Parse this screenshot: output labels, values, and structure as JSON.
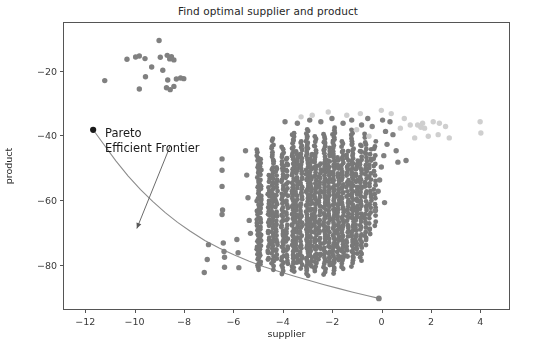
{
  "chart_data": {
    "type": "scatter",
    "title": "Find optimal supplier and product",
    "xlabel": "supplier",
    "ylabel": "product",
    "xlim": [
      -12.9,
      5.2
    ],
    "ylim": [
      -94.0,
      -5.0
    ],
    "grid": false,
    "legend": null,
    "xticks": [
      -12,
      -10,
      -8,
      -6,
      -4,
      -2,
      0,
      2,
      4
    ],
    "xtick_labels": [
      "−12",
      "−10",
      "−8",
      "−6",
      "−4",
      "−2",
      "0",
      "2",
      "4"
    ],
    "yticks": [
      -20,
      -40,
      -60,
      -80
    ],
    "ytick_labels": [
      "−20",
      "−40",
      "−60",
      "−80"
    ],
    "annotations": [
      {
        "text_lines": [
          "Pareto",
          "Efficient Frontier"
        ],
        "text_x": -10.3,
        "text_y": -30.5,
        "arrow_tip_x": -9.95,
        "arrow_tip_y": -68.5,
        "arrow_tail_x": -8.6,
        "arrow_tail_y": -43.0
      }
    ],
    "series": [
      {
        "name": "pareto-frontier-curve",
        "type": "line",
        "color": "#8c8c8c",
        "linewidth": 1.1,
        "points": [
          [
            -11.72,
            -38.0
          ],
          [
            -11.3,
            -42.4
          ],
          [
            -10.8,
            -47.6
          ],
          [
            -10.3,
            -52.3
          ],
          [
            -9.8,
            -56.5
          ],
          [
            -9.3,
            -60.2
          ],
          [
            -8.8,
            -63.6
          ],
          [
            -8.3,
            -66.6
          ],
          [
            -7.8,
            -69.3
          ],
          [
            -7.2,
            -72.2
          ],
          [
            -6.6,
            -74.6
          ],
          [
            -6.0,
            -76.7
          ],
          [
            -5.4,
            -78.6
          ],
          [
            -4.8,
            -80.3
          ],
          [
            -4.2,
            -81.8
          ],
          [
            -3.6,
            -83.2
          ],
          [
            -3.0,
            -84.5
          ],
          [
            -2.4,
            -85.8
          ],
          [
            -1.8,
            -87.0
          ],
          [
            -1.2,
            -88.2
          ],
          [
            -0.6,
            -89.3
          ],
          [
            -0.15,
            -90.1
          ]
        ]
      },
      {
        "name": "frontier-endpoint-optimal",
        "type": "scatter",
        "color": "#1a1a1a",
        "size": 5.0,
        "points": [
          [
            -11.72,
            -38.0
          ]
        ]
      },
      {
        "name": "frontier-endpoint-right",
        "type": "scatter",
        "color": "#808080",
        "size": 4.6,
        "points": [
          [
            -0.15,
            -90.1
          ]
        ]
      },
      {
        "name": "frontier-point-mid",
        "type": "scatter",
        "color": "#808080",
        "size": 4.2,
        "points": [
          [
            -7.22,
            -82.1
          ]
        ]
      },
      {
        "name": "upper-left-cluster",
        "type": "scatter",
        "color": "#808080",
        "size": 4.2,
        "points": [
          [
            -9.05,
            -10.4
          ],
          [
            -10.35,
            -16.2
          ],
          [
            -10.0,
            -15.5
          ],
          [
            -9.85,
            -15.2
          ],
          [
            -9.62,
            -16.0
          ],
          [
            -9.0,
            -15.6
          ],
          [
            -8.72,
            -15.0
          ],
          [
            -8.55,
            -15.4
          ],
          [
            -8.62,
            -16.1
          ],
          [
            -8.45,
            -16.4
          ],
          [
            -9.35,
            -18.6
          ],
          [
            -8.9,
            -19.6
          ],
          [
            -9.6,
            -21.6
          ],
          [
            -8.7,
            -22.6
          ],
          [
            -8.35,
            -22.3
          ],
          [
            -8.18,
            -22.0
          ],
          [
            -8.05,
            -22.2
          ],
          [
            -11.25,
            -22.8
          ],
          [
            -9.85,
            -25.4
          ],
          [
            -8.75,
            -25.0
          ],
          [
            -8.6,
            -25.6
          ],
          [
            -8.45,
            -24.6
          ]
        ]
      },
      {
        "name": "sparse-mid-left-points",
        "type": "scatter",
        "color": "#808080",
        "size": 4.2,
        "points": [
          [
            -6.5,
            -47.0
          ],
          [
            -6.5,
            -50.5
          ],
          [
            -6.5,
            -55.5
          ],
          [
            -6.48,
            -62.8
          ],
          [
            -6.5,
            -64.2
          ],
          [
            -6.45,
            -73.0
          ],
          [
            -6.42,
            -75.6
          ],
          [
            -6.4,
            -77.4
          ],
          [
            -6.4,
            -80.5
          ],
          [
            -7.05,
            -73.5
          ],
          [
            -7.1,
            -78.1
          ],
          [
            -5.9,
            -71.9
          ],
          [
            -5.85,
            -76.0
          ],
          [
            -5.82,
            -80.6
          ],
          [
            -5.55,
            -44.5
          ],
          [
            -5.5,
            -52.0
          ],
          [
            -5.45,
            -59.0
          ],
          [
            -5.4,
            -66.0
          ],
          [
            -5.35,
            -70.0
          ]
        ]
      },
      {
        "name": "dense-striped-band",
        "type": "scatter-columns",
        "color": "#787878",
        "size": 3.9,
        "columns": [
          {
            "x": -5.05,
            "ymin": -82.0,
            "ymax": -44.0,
            "n": 46
          },
          {
            "x": -4.95,
            "ymin": -80.0,
            "ymax": -47.0,
            "n": 34
          },
          {
            "x": -4.62,
            "ymin": -79.0,
            "ymax": -52.0,
            "n": 26
          },
          {
            "x": -4.45,
            "ymin": -81.5,
            "ymax": -40.5,
            "n": 52
          },
          {
            "x": -4.3,
            "ymin": -78.0,
            "ymax": -49.0,
            "n": 30
          },
          {
            "x": -4.05,
            "ymin": -83.0,
            "ymax": -43.0,
            "n": 48
          },
          {
            "x": -3.88,
            "ymin": -80.0,
            "ymax": -46.0,
            "n": 36
          },
          {
            "x": -3.62,
            "ymin": -82.5,
            "ymax": -38.5,
            "n": 62
          },
          {
            "x": -3.48,
            "ymin": -79.5,
            "ymax": -44.0,
            "n": 40
          },
          {
            "x": -3.3,
            "ymin": -81.0,
            "ymax": -41.0,
            "n": 50
          },
          {
            "x": -3.05,
            "ymin": -83.5,
            "ymax": -37.5,
            "n": 66
          },
          {
            "x": -2.9,
            "ymin": -80.5,
            "ymax": -45.0,
            "n": 42
          },
          {
            "x": -2.72,
            "ymin": -82.0,
            "ymax": -40.0,
            "n": 54
          },
          {
            "x": -2.55,
            "ymin": -78.5,
            "ymax": -48.0,
            "n": 32
          },
          {
            "x": -2.35,
            "ymin": -83.0,
            "ymax": -39.0,
            "n": 58
          },
          {
            "x": -2.18,
            "ymin": -80.0,
            "ymax": -43.5,
            "n": 44
          },
          {
            "x": -1.98,
            "ymin": -82.5,
            "ymax": -37.0,
            "n": 64
          },
          {
            "x": -1.8,
            "ymin": -79.0,
            "ymax": -46.5,
            "n": 38
          },
          {
            "x": -1.62,
            "ymin": -81.5,
            "ymax": -41.5,
            "n": 50
          },
          {
            "x": -1.42,
            "ymin": -78.0,
            "ymax": -44.5,
            "n": 36
          },
          {
            "x": -1.22,
            "ymin": -80.5,
            "ymax": -38.0,
            "n": 56
          },
          {
            "x": -1.05,
            "ymin": -76.5,
            "ymax": -47.0,
            "n": 30
          },
          {
            "x": -0.88,
            "ymin": -79.0,
            "ymax": -42.0,
            "n": 40
          },
          {
            "x": -0.68,
            "ymin": -74.0,
            "ymax": -39.0,
            "n": 34
          },
          {
            "x": -0.5,
            "ymin": -71.0,
            "ymax": -44.0,
            "n": 24
          },
          {
            "x": -0.32,
            "ymin": -68.0,
            "ymax": -41.0,
            "n": 20
          }
        ]
      },
      {
        "name": "right-tail-dark-points",
        "type": "scatter",
        "color": "#808080",
        "size": 4.2,
        "points": [
          [
            -0.18,
            -57.0
          ],
          [
            -0.12,
            -53.5
          ],
          [
            -0.05,
            -49.5
          ],
          [
            0.05,
            -46.0
          ],
          [
            0.18,
            -42.5
          ],
          [
            0.12,
            -38.5
          ],
          [
            0.42,
            -39.5
          ],
          [
            0.3,
            -35.5
          ],
          [
            0.55,
            -44.5
          ],
          [
            0.08,
            -60.5
          ],
          [
            -0.3,
            -63.0
          ],
          [
            0.62,
            -48.0
          ],
          [
            0.95,
            -47.5
          ],
          [
            -0.42,
            -37.0
          ],
          [
            0.0,
            -35.0
          ],
          [
            -0.6,
            -34.5
          ],
          [
            -0.85,
            -36.5
          ],
          [
            -1.25,
            -35.0
          ],
          [
            -1.6,
            -36.0
          ],
          [
            -2.05,
            -34.5
          ],
          [
            -2.5,
            -35.5
          ],
          [
            -2.95,
            -35.0
          ],
          [
            -3.45,
            -36.0
          ],
          [
            -3.95,
            -35.5
          ]
        ]
      },
      {
        "name": "right-light-cluster",
        "type": "scatter",
        "color": "#cfcfcf",
        "size": 4.2,
        "points": [
          [
            1.42,
            -36.5
          ],
          [
            1.55,
            -37.2
          ],
          [
            1.62,
            -36.0
          ],
          [
            1.7,
            -37.5
          ],
          [
            2.05,
            -35.5
          ],
          [
            2.3,
            -36.0
          ],
          [
            2.55,
            -37.0
          ],
          [
            2.25,
            -39.5
          ],
          [
            2.7,
            -40.5
          ],
          [
            1.85,
            -40.0
          ],
          [
            3.95,
            -35.5
          ],
          [
            3.98,
            -39.0
          ],
          [
            1.12,
            -36.5
          ],
          [
            0.88,
            -34.5
          ],
          [
            0.72,
            -37.5
          ],
          [
            1.3,
            -40.5
          ],
          [
            0.35,
            -33.0
          ],
          [
            -0.05,
            -32.0
          ],
          [
            -0.9,
            -33.0
          ],
          [
            -1.45,
            -33.5
          ],
          [
            -2.2,
            -32.5
          ],
          [
            -2.85,
            -33.5
          ],
          [
            -3.3,
            -34.0
          ],
          [
            -1.05,
            -38.0
          ],
          [
            -0.55,
            -40.0
          ]
        ]
      }
    ]
  }
}
